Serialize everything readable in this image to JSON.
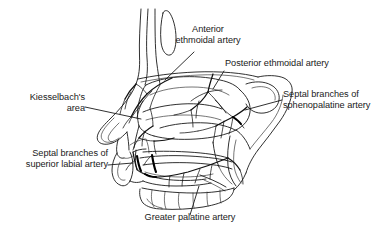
{
  "figure": {
    "title": "Arterial blood supply of the nasal septum",
    "background_color": "#ffffff",
    "line_color": "#1a1a1a",
    "width": 387,
    "height": 240
  },
  "labels": [
    {
      "id": "anterior-ethmoidal-artery",
      "text": "Anterior\nethmoidal artery",
      "align": "center"
    },
    {
      "id": "posterior-ethmoidal-artery",
      "text": "Posterior ethmoidal artery",
      "align": "left"
    },
    {
      "id": "septal-branches-sphenopalatine-artery",
      "text": "Septal branches of\nsphenopalatine artery",
      "align": "left"
    },
    {
      "id": "kiesselbachs-area",
      "text": "Kiesselbach's\narea",
      "align": "right"
    },
    {
      "id": "septal-branches-superior-labial-artery",
      "text": "Septal branches of\nsuperior labial artery",
      "align": "right"
    },
    {
      "id": "greater-palatine-artery",
      "text": "Greater palatine artery",
      "align": "center"
    }
  ]
}
